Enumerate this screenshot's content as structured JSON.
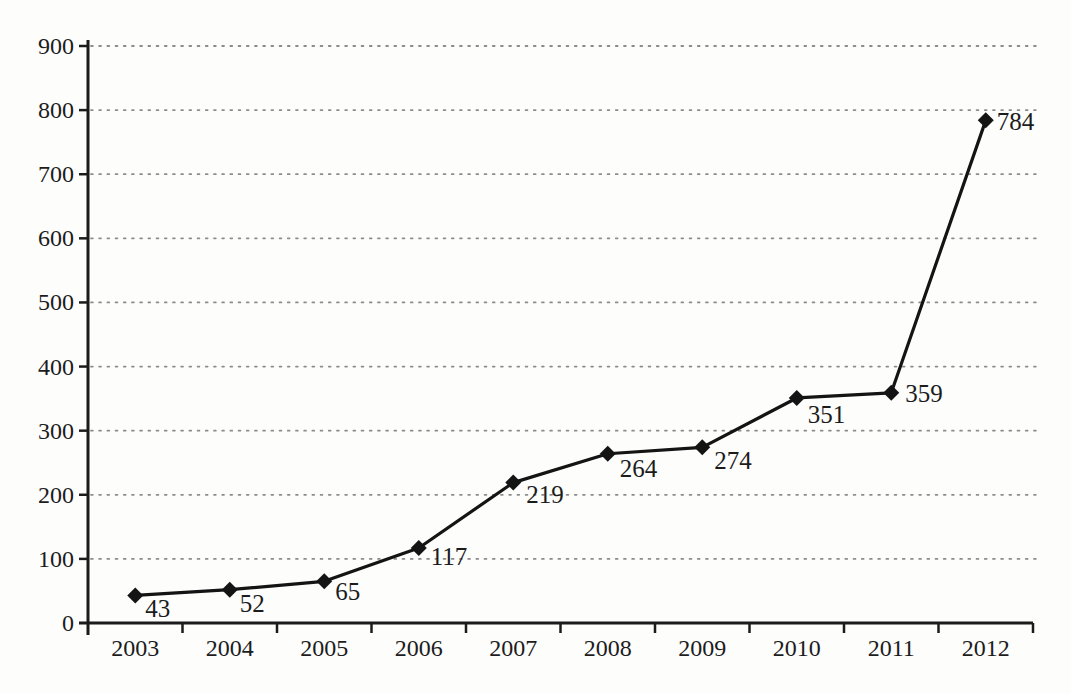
{
  "chart_data": {
    "type": "line",
    "title": "",
    "xlabel": "",
    "ylabel": "",
    "categories": [
      "2003",
      "2004",
      "2005",
      "2006",
      "2007",
      "2008",
      "2009",
      "2010",
      "2011",
      "2012"
    ],
    "values": [
      43,
      52,
      65,
      117,
      219,
      264,
      274,
      351,
      359,
      784
    ],
    "data_labels": [
      "43",
      "52",
      "65",
      "117",
      "219",
      "264",
      "274",
      "351",
      "359",
      "784"
    ],
    "ylim": [
      0,
      900
    ],
    "ytick_interval": 100,
    "yticks": [
      "0",
      "100",
      "200",
      "300",
      "400",
      "500",
      "600",
      "700",
      "800",
      "900"
    ],
    "grid": "horizontal-dotted",
    "legend": "none",
    "marker": "diamond",
    "line_color": "#141414",
    "marker_color": "#141414",
    "grid_color": "#8c8c8c",
    "axis_color": "#1b1b1b",
    "text_color": "#1c1c1c",
    "label_offsets": [
      [
        10,
        22
      ],
      [
        10,
        22
      ],
      [
        11,
        19
      ],
      [
        12,
        17
      ],
      [
        13,
        20
      ],
      [
        12,
        23
      ],
      [
        12,
        22
      ],
      [
        11,
        25
      ],
      [
        14,
        9
      ],
      [
        11,
        10
      ]
    ]
  }
}
